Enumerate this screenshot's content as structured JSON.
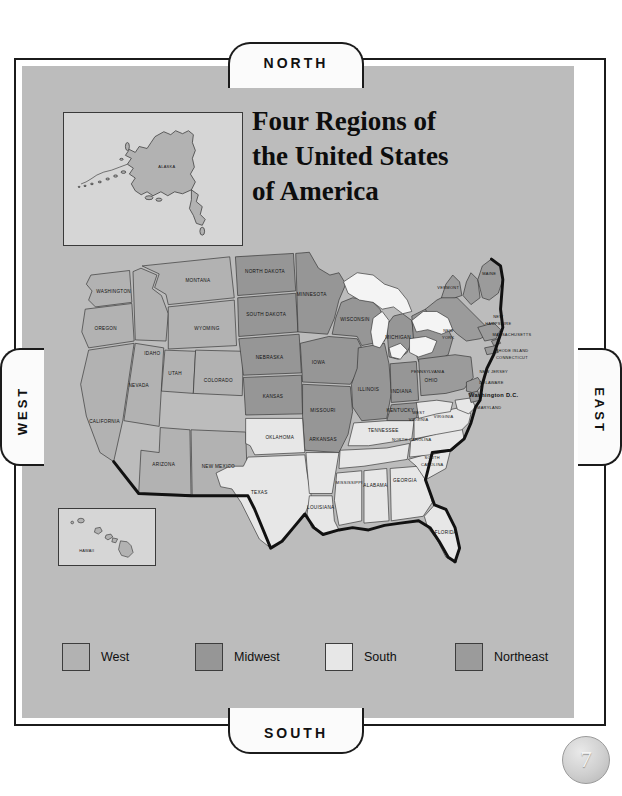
{
  "page": {
    "number": "7",
    "background_color": "#ffffff",
    "panel_color": "#bcbcbc"
  },
  "compass": {
    "north": "NORTH",
    "south": "SOUTH",
    "west": "WEST",
    "east": "EAST"
  },
  "title": {
    "line1": "Four Regions of",
    "line2": "the United States",
    "line3": "of America"
  },
  "insets": {
    "alaska": {
      "label": "ALASKA",
      "region": "West"
    },
    "hawaii": {
      "label": "HAWAII",
      "region": "West"
    }
  },
  "legend": {
    "items": [
      {
        "label": "West",
        "color": "#b2b2b2"
      },
      {
        "label": "Midwest",
        "color": "#969696"
      },
      {
        "label": "South",
        "color": "#e7e7e7"
      },
      {
        "label": "Northeast",
        "color": "#9b9b9b"
      }
    ]
  },
  "region_colors": {
    "west": "#b2b2b2",
    "midwest": "#969696",
    "south": "#e7e7e7",
    "northeast": "#9b9b9b",
    "water": "#f2f2f2",
    "border": "#2b2b2b",
    "coast": "#111111"
  },
  "map": {
    "states": [
      {
        "name": "WASHINGTON",
        "region": "west",
        "x": 38,
        "y": 37
      },
      {
        "name": "OREGON",
        "region": "west",
        "x": 31,
        "y": 72
      },
      {
        "name": "CALIFORNIA",
        "region": "west",
        "x": 30,
        "y": 154
      },
      {
        "name": "NEVADA",
        "region": "west",
        "x": 57,
        "y": 122
      },
      {
        "name": "IDAHO",
        "region": "west",
        "x": 72,
        "y": 93
      },
      {
        "name": "MONTANA",
        "region": "west",
        "x": 110,
        "y": 56
      },
      {
        "name": "WYOMING",
        "region": "west",
        "x": 117,
        "y": 101
      },
      {
        "name": "UTAH",
        "region": "west",
        "x": 83,
        "y": 140
      },
      {
        "name": "COLORADO",
        "region": "west",
        "x": 128,
        "y": 146
      },
      {
        "name": "ARIZONA",
        "region": "west",
        "x": 82,
        "y": 195
      },
      {
        "name": "NEW MEXICO",
        "region": "west",
        "x": 130,
        "y": 198
      },
      {
        "name": "NORTH DAKOTA",
        "region": "midwest",
        "x": 170,
        "y": 45
      },
      {
        "name": "SOUTH DAKOTA",
        "region": "midwest",
        "x": 170,
        "y": 81
      },
      {
        "name": "NEBRASKA",
        "region": "midwest",
        "x": 172,
        "y": 117
      },
      {
        "name": "KANSAS",
        "region": "midwest",
        "x": 178,
        "y": 152
      },
      {
        "name": "MINNESOTA",
        "region": "midwest",
        "x": 208,
        "y": 63
      },
      {
        "name": "IOWA",
        "region": "midwest",
        "x": 212,
        "y": 116
      },
      {
        "name": "MISSOURI",
        "region": "midwest",
        "x": 223,
        "y": 155
      },
      {
        "name": "WISCONSIN",
        "region": "midwest",
        "x": 241,
        "y": 80
      },
      {
        "name": "ILLINOIS",
        "region": "midwest",
        "x": 250,
        "y": 133
      },
      {
        "name": "INDIANA",
        "region": "midwest",
        "x": 275,
        "y": 134
      },
      {
        "name": "MICHIGAN",
        "region": "midwest",
        "x": 280,
        "y": 95
      },
      {
        "name": "OHIO",
        "region": "midwest",
        "x": 300,
        "y": 129
      },
      {
        "name": "OKLAHOMA",
        "region": "south",
        "x": 190,
        "y": 190
      },
      {
        "name": "TEXAS",
        "region": "south",
        "x": 173,
        "y": 234
      },
      {
        "name": "ARKANSAS",
        "region": "south",
        "x": 228,
        "y": 193
      },
      {
        "name": "LOUISIANA",
        "region": "south",
        "x": 228,
        "y": 237
      },
      {
        "name": "MISSISSIPPI",
        "region": "south",
        "x": 252,
        "y": 209
      },
      {
        "name": "ALABAMA",
        "region": "south",
        "x": 277,
        "y": 211
      },
      {
        "name": "TENNESSEE",
        "region": "south",
        "x": 275,
        "y": 179
      },
      {
        "name": "KENTUCKY",
        "region": "south",
        "x": 286,
        "y": 156
      },
      {
        "name": "GEORGIA",
        "region": "south",
        "x": 301,
        "y": 206
      },
      {
        "name": "FLORIDA",
        "region": "south",
        "x": 331,
        "y": 252
      },
      {
        "name": "SOUTH CAROLINA",
        "region": "south",
        "x": 322,
        "y": 189
      },
      {
        "name": "NORTH CAROLINA",
        "region": "south",
        "x": 325,
        "y": 171
      },
      {
        "name": "VIRGINIA",
        "region": "south",
        "x": 329,
        "y": 149
      },
      {
        "name": "WEST VIRGINIA",
        "region": "south",
        "x": 309,
        "y": 146
      },
      {
        "name": "MARYLAND",
        "region": "south",
        "x": 345,
        "y": 141
      },
      {
        "name": "Washington D.C.",
        "region": "south",
        "x": 350,
        "y": 131
      },
      {
        "name": "DELAWARE",
        "region": "northeast",
        "x": 350,
        "y": 121
      },
      {
        "name": "PENNSYLVANIA",
        "region": "northeast",
        "x": 325,
        "y": 104
      },
      {
        "name": "NEW JERSEY",
        "region": "northeast",
        "x": 352,
        "y": 110
      },
      {
        "name": "NEW YORK",
        "region": "northeast",
        "x": 330,
        "y": 79
      },
      {
        "name": "CONNECTICUT",
        "region": "northeast",
        "x": 363,
        "y": 94
      },
      {
        "name": "RHODE ISLAND",
        "region": "northeast",
        "x": 363,
        "y": 88
      },
      {
        "name": "MASSACHUSETTS",
        "region": "northeast",
        "x": 368,
        "y": 75
      },
      {
        "name": "NEW HAMPSHIRE",
        "region": "northeast",
        "x": 355,
        "y": 62
      },
      {
        "name": "VERMONT",
        "region": "northeast",
        "x": 333,
        "y": 50
      },
      {
        "name": "MAINE",
        "region": "northeast",
        "x": 366,
        "y": 38
      }
    ]
  }
}
